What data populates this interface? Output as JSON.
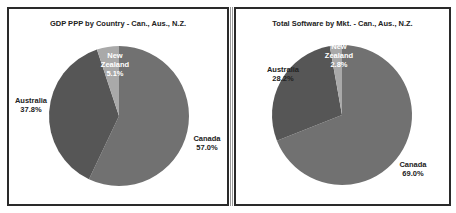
{
  "chart_data": [
    {
      "type": "pie",
      "title": "GDP PPP by Country - Can., Aus., N.Z.",
      "slices": [
        {
          "label": "Canada",
          "value": 57.0,
          "display": "57.0%",
          "color": "#717171",
          "text_color": "#222222"
        },
        {
          "label": "Australia",
          "value": 37.8,
          "display": "37.8%",
          "color": "#565656",
          "text_color": "#222222"
        },
        {
          "label": "New Zealand",
          "value": 5.1,
          "display": "5.1%",
          "color": "#a9a9a9",
          "text_color": "#ffffff"
        }
      ],
      "start": "12 o'clock",
      "direction": "clockwise",
      "legend": "none"
    },
    {
      "type": "pie",
      "title": "Total Software by Mkt. - Can., Aus., N.Z.",
      "slices": [
        {
          "label": "Canada",
          "value": 69.0,
          "display": "69.0%",
          "color": "#717171",
          "text_color": "#222222"
        },
        {
          "label": "Australia",
          "value": 28.2,
          "display": "28.2%",
          "color": "#565656",
          "text_color": "#222222"
        },
        {
          "label": "New Zealand",
          "value": 2.8,
          "display": "2.8%",
          "color": "#a9a9a9",
          "text_color": "#ffffff"
        }
      ],
      "start": "12 o'clock",
      "direction": "clockwise",
      "legend": "none"
    }
  ]
}
